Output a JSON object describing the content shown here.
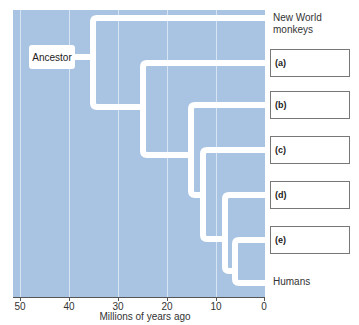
{
  "diagram": {
    "type": "phylogenetic-tree",
    "root_label": "Ancestor",
    "x_axis": {
      "label": "Millions of years ago",
      "ticks": [
        "50",
        "40",
        "30",
        "20",
        "10",
        "0"
      ]
    },
    "leaves": [
      {
        "id": "nwm",
        "label": "New World monkeys",
        "type": "text"
      },
      {
        "id": "a",
        "label": "(a)",
        "type": "blank-box"
      },
      {
        "id": "b",
        "label": "(b)",
        "type": "blank-box"
      },
      {
        "id": "c",
        "label": "(c)",
        "type": "blank-box"
      },
      {
        "id": "d",
        "label": "(d)",
        "type": "blank-box"
      },
      {
        "id": "e",
        "label": "(e)",
        "type": "blank-box"
      },
      {
        "id": "humans",
        "label": "Humans",
        "type": "text"
      }
    ],
    "branch_points_mya": [
      35,
      25,
      15,
      12,
      8,
      6
    ],
    "colors": {
      "plot_bg": "#a9c4e2",
      "branch": "#ffffff",
      "grid": "#d6e4f3"
    }
  }
}
